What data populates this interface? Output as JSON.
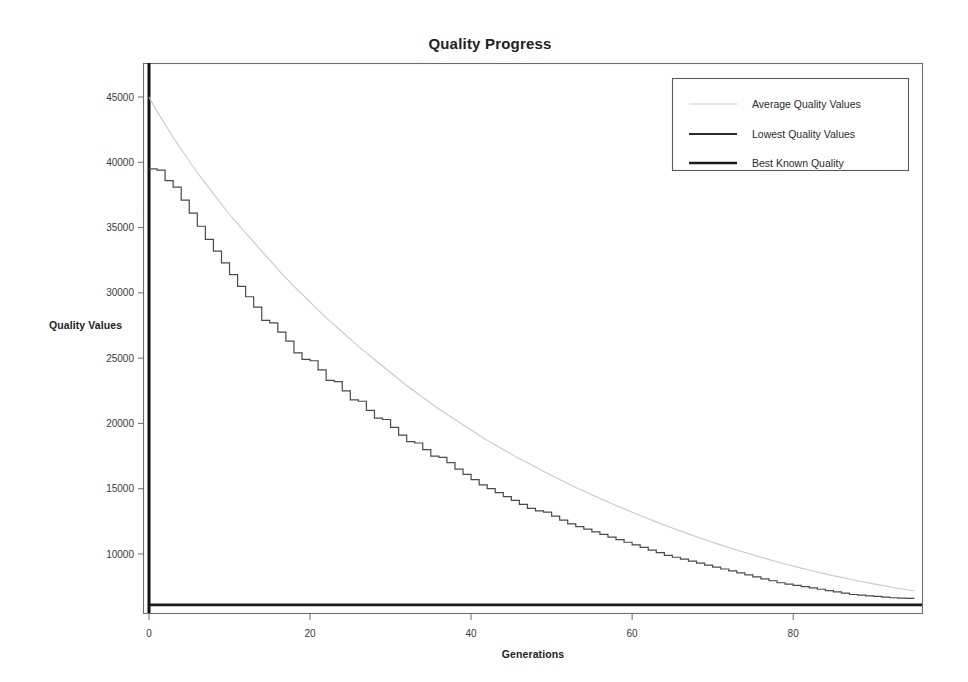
{
  "chart_data": {
    "type": "line",
    "title": "Quality Progress",
    "xlabel": "Generations",
    "ylabel": "Quality Values",
    "xlim": [
      0,
      96
    ],
    "ylim": [
      5600,
      47500
    ],
    "xticks": [
      0,
      20,
      40,
      60,
      80
    ],
    "yticks": [
      10000,
      15000,
      20000,
      25000,
      30000,
      35000,
      40000,
      45000
    ],
    "xtick_labels": [
      "0",
      "20",
      "40",
      "60",
      "80"
    ],
    "ytick_labels": [
      "10000",
      "15000",
      "20000",
      "25000",
      "30000",
      "35000",
      "40000",
      "45000"
    ],
    "grid": false,
    "legend_position": "top-right",
    "legend": [
      "Average Quality Values",
      "Lowest Quality Values",
      "Best Known Quality"
    ],
    "colors": {
      "average": "#c9c9c9",
      "lowest": "#4a4a4a",
      "best": "#1a1a1a",
      "frame": "#6e6e6e",
      "background": "#ffffff",
      "text": "#222222"
    },
    "x": [
      0,
      1,
      2,
      3,
      4,
      5,
      6,
      7,
      8,
      9,
      10,
      11,
      12,
      13,
      14,
      15,
      16,
      17,
      18,
      19,
      20,
      21,
      22,
      23,
      24,
      25,
      26,
      27,
      28,
      29,
      30,
      31,
      32,
      33,
      34,
      35,
      36,
      37,
      38,
      39,
      40,
      41,
      42,
      43,
      44,
      45,
      46,
      47,
      48,
      49,
      50,
      51,
      52,
      53,
      54,
      55,
      56,
      57,
      58,
      59,
      60,
      61,
      62,
      63,
      64,
      65,
      66,
      67,
      68,
      69,
      70,
      71,
      72,
      73,
      74,
      75,
      76,
      77,
      78,
      79,
      80,
      81,
      82,
      83,
      84,
      85,
      86,
      87,
      88,
      89,
      90,
      91,
      92,
      93,
      94,
      95
    ],
    "series": [
      {
        "name": "Average Quality Values",
        "style": "thin-light",
        "values": [
          45000,
          43900,
          42900,
          41900,
          41000,
          40100,
          39200,
          38400,
          37600,
          36800,
          36000,
          35300,
          34600,
          33900,
          33200,
          32500,
          31800,
          31150,
          30500,
          29900,
          29300,
          28700,
          28100,
          27550,
          27000,
          26450,
          25900,
          25400,
          24900,
          24400,
          23900,
          23400,
          22900,
          22450,
          22000,
          21550,
          21100,
          20700,
          20300,
          19900,
          19500,
          19100,
          18700,
          18350,
          18000,
          17650,
          17300,
          16980,
          16660,
          16340,
          16020,
          15700,
          15400,
          15100,
          14820,
          14540,
          14260,
          13990,
          13720,
          13460,
          13200,
          12950,
          12700,
          12460,
          12220,
          11990,
          11760,
          11540,
          11320,
          11110,
          10900,
          10700,
          10500,
          10310,
          10120,
          9940,
          9760,
          9580,
          9410,
          9240,
          9080,
          8920,
          8770,
          8620,
          8480,
          8340,
          8210,
          8080,
          7950,
          7830,
          7710,
          7600,
          7490,
          7380,
          7280,
          7180
        ]
      },
      {
        "name": "Lowest Quality Values",
        "style": "thin-dark-stepped",
        "values": [
          39500,
          39400,
          38600,
          38100,
          37100,
          36100,
          35100,
          34100,
          33200,
          32300,
          31400,
          30500,
          29700,
          28900,
          27900,
          27700,
          27000,
          26300,
          25400,
          24900,
          24800,
          24100,
          23300,
          23200,
          22500,
          21800,
          21700,
          21000,
          20400,
          20300,
          19700,
          19100,
          18600,
          18500,
          18000,
          17500,
          17400,
          17000,
          16500,
          16100,
          15700,
          15300,
          15000,
          14700,
          14400,
          14100,
          13800,
          13500,
          13300,
          13200,
          12900,
          12600,
          12300,
          12100,
          11900,
          11700,
          11500,
          11300,
          11100,
          10900,
          10700,
          10500,
          10300,
          10100,
          9900,
          9750,
          9600,
          9450,
          9300,
          9150,
          9000,
          8850,
          8700,
          8550,
          8400,
          8250,
          8100,
          7950,
          7800,
          7700,
          7600,
          7500,
          7400,
          7300,
          7200,
          7100,
          7000,
          6900,
          6850,
          6800,
          6750,
          6700,
          6650,
          6620,
          6600,
          6580
        ]
      },
      {
        "name": "Best Known Quality",
        "style": "thick-dark-constant",
        "constant": 6100,
        "values": [
          6100,
          6100,
          6100,
          6100,
          6100,
          6100,
          6100,
          6100,
          6100,
          6100,
          6100,
          6100,
          6100,
          6100,
          6100,
          6100,
          6100,
          6100,
          6100,
          6100,
          6100,
          6100,
          6100,
          6100,
          6100,
          6100,
          6100,
          6100,
          6100,
          6100,
          6100,
          6100,
          6100,
          6100,
          6100,
          6100,
          6100,
          6100,
          6100,
          6100,
          6100,
          6100,
          6100,
          6100,
          6100,
          6100,
          6100,
          6100,
          6100,
          6100,
          6100,
          6100,
          6100,
          6100,
          6100,
          6100,
          6100,
          6100,
          6100,
          6100,
          6100,
          6100,
          6100,
          6100,
          6100,
          6100,
          6100,
          6100,
          6100,
          6100,
          6100,
          6100,
          6100,
          6100,
          6100,
          6100,
          6100,
          6100,
          6100,
          6100,
          6100,
          6100,
          6100,
          6100,
          6100,
          6100,
          6100,
          6100,
          6100,
          6100,
          6100,
          6100,
          6100,
          6100,
          6100,
          6100
        ]
      }
    ]
  }
}
